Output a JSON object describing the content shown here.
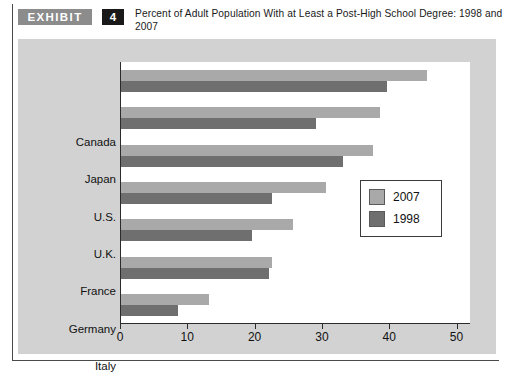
{
  "exhibit": {
    "badge_label": "EXHIBIT",
    "number": "4",
    "title": "Percent of Adult Population With at Least a Post-High School Degree: 1998 and 2007"
  },
  "colors": {
    "series_2007": "#a9a9a9",
    "series_1998": "#6f6f6f",
    "panel_background": "#d2d2d2",
    "plot_background": "#ffffff",
    "axis": "#2b2b2b"
  },
  "legend": {
    "position": "inside-right",
    "entries": [
      {
        "label": "2007",
        "color": "#a9a9a9"
      },
      {
        "label": "1998",
        "color": "#6f6f6f"
      }
    ]
  },
  "chart_data": {
    "type": "bar",
    "orientation": "horizontal",
    "title": "Percent of Adult Population With at Least a Post-High School Degree: 1998 and 2007",
    "xlabel": "",
    "ylabel": "",
    "xlim": [
      0,
      52
    ],
    "grid": false,
    "categories": [
      "Canada",
      "Japan",
      "U.S.",
      "U.K.",
      "France",
      "Germany",
      "Italy"
    ],
    "xticks": [
      0,
      10,
      20,
      30,
      40,
      50
    ],
    "xtick_labels": [
      "0",
      "10",
      "20",
      "30",
      "40",
      "50"
    ],
    "series": [
      {
        "name": "2007",
        "color": "#a9a9a9",
        "values": [
          45.5,
          38.5,
          37.5,
          30.5,
          25.5,
          22.5,
          13
        ]
      },
      {
        "name": "1998",
        "color": "#6f6f6f",
        "values": [
          39.5,
          29,
          33,
          22.5,
          19.5,
          22,
          8.5
        ]
      }
    ]
  }
}
